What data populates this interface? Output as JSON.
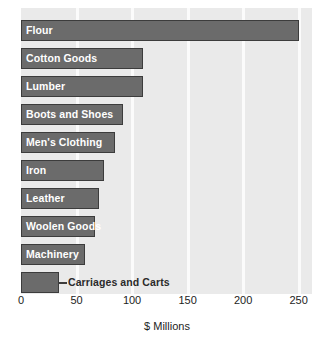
{
  "chart_data": {
    "type": "bar",
    "orientation": "horizontal",
    "title": "",
    "xlabel": "$ Millions",
    "ylabel": "",
    "xlim": [
      0,
      262
    ],
    "xticks": [
      0,
      50,
      100,
      150,
      200,
      250
    ],
    "xtick_labels": [
      "0",
      "50",
      "100",
      "150",
      "200",
      "250"
    ],
    "grid": "vertical",
    "legend": "none",
    "categories": [
      "Flour",
      "Cotton Goods",
      "Lumber",
      "Boots and Shoes",
      "Men's Clothing",
      "Iron",
      "Leather",
      "Woolen Goods",
      "Machinery",
      "Carriages and Carts"
    ],
    "values": [
      250,
      110,
      110,
      92,
      85,
      75,
      70,
      67,
      58,
      34
    ],
    "bars": [
      {
        "label": "Flour",
        "value": 250,
        "label_position": "inside"
      },
      {
        "label": "Cotton Goods",
        "value": 110,
        "label_position": "inside"
      },
      {
        "label": "Lumber",
        "value": 110,
        "label_position": "inside"
      },
      {
        "label": "Boots and Shoes",
        "value": 92,
        "label_position": "inside"
      },
      {
        "label": "Men's Clothing",
        "value": 85,
        "label_position": "inside"
      },
      {
        "label": "Iron",
        "value": 75,
        "label_position": "inside"
      },
      {
        "label": "Leather",
        "value": 70,
        "label_position": "inside"
      },
      {
        "label": "Woolen Goods",
        "value": 67,
        "label_position": "inside"
      },
      {
        "label": "Machinery",
        "value": 58,
        "label_position": "inside"
      },
      {
        "label": "Carriages and Carts",
        "value": 34,
        "label_position": "outside"
      }
    ],
    "colors": {
      "bar_fill": "#6b6b6b",
      "bar_border": "#3c3c3c",
      "plot_background": "#eaeaea",
      "gridline": "#fbfbfb",
      "inside_label_text": "#ffffff",
      "outside_label_text": "#2b2b2b",
      "axis_text": "#1d1d1d",
      "figure_background": "#ffffff"
    }
  }
}
